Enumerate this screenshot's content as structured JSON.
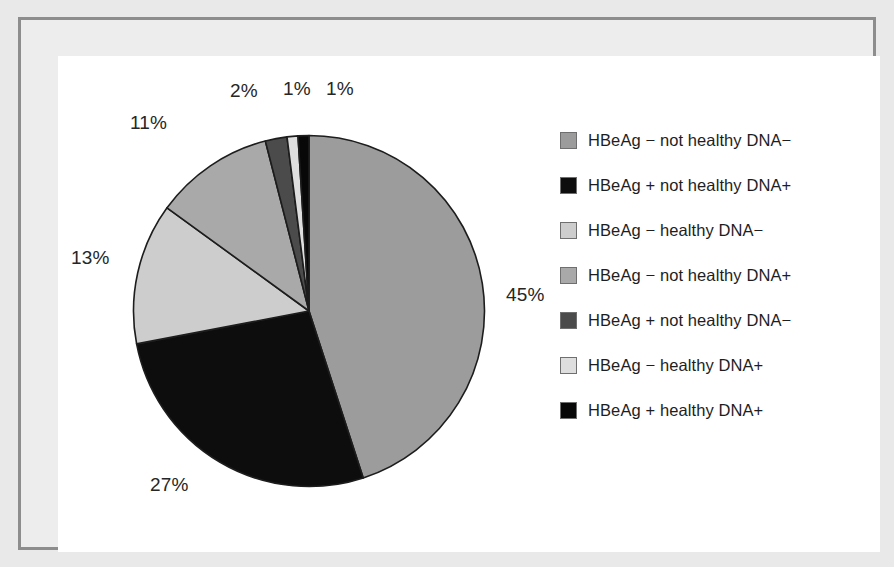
{
  "chart_data": {
    "type": "pie",
    "title": "",
    "xlabel": "",
    "ylabel": "",
    "legend_position": "right",
    "grid": false,
    "start_angle_deg": 0,
    "direction": "clockwise",
    "categories": [
      "HBeAg − not healthy DNA−",
      "HBeAg + not healthy DNA+",
      "HBeAg − healthy DNA−",
      "HBeAg − not healthy DNA+",
      "HBeAg + not healthy DNA−",
      "HBeAg − healthy DNA+",
      "HBeAg + healthy DNA+"
    ],
    "values": [
      45,
      27,
      13,
      11,
      2,
      1,
      1
    ],
    "value_labels": [
      "45%",
      "27%",
      "13%",
      "11%",
      "2%",
      "1%",
      "1%"
    ],
    "colors": [
      "#9c9c9c",
      "#0d0d0d",
      "#cdcdcd",
      "#a9a9a9",
      "#4b4b4b",
      "#dedede",
      "#080808"
    ],
    "slice_order_clockwise_from_top": [
      "HBeAg − not healthy DNA−",
      "HBeAg + not healthy DNA+",
      "HBeAg − healthy DNA−",
      "HBeAg − not healthy DNA+",
      "HBeAg + not healthy DNA−",
      "HBeAg − healthy DNA+",
      "HBeAg + healthy DNA+"
    ]
  },
  "labels": {
    "pct_45": "45%",
    "pct_27": "27%",
    "pct_13": "13%",
    "pct_11": "11%",
    "pct_2": "2%",
    "pct_1_a": "1%",
    "pct_1_b": "1%"
  },
  "legend": {
    "items": [
      {
        "label": "HBeAg − not healthy DNA−",
        "color": "#9c9c9c"
      },
      {
        "label": "HBeAg + not healthy DNA+",
        "color": "#0d0d0d"
      },
      {
        "label": "HBeAg − healthy DNA−",
        "color": "#cdcdcd"
      },
      {
        "label": "HBeAg − not healthy DNA+",
        "color": "#a9a9a9"
      },
      {
        "label": "HBeAg + not healthy DNA−",
        "color": "#4b4b4b"
      },
      {
        "label": "HBeAg − healthy DNA+",
        "color": "#dedede"
      },
      {
        "label": "HBeAg + healthy DNA+",
        "color": "#080808"
      }
    ]
  },
  "frame": {
    "mat_color": "#e9e9e9",
    "border_color": "#8d8d8d",
    "canvas_color": "#ffffff"
  }
}
